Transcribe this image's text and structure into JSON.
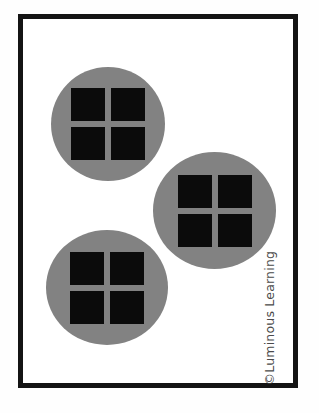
{
  "page": {
    "background_color": "#fefefe",
    "frame_color": "#141414",
    "frame_fill": "#ffffff"
  },
  "colors": {
    "circle_gray": "#828282",
    "square_black": "#0b0b0b",
    "copyright_gray": "#4a4a4a"
  },
  "manipulative": {
    "kind": "grouped-unit-squares",
    "group_count": 3,
    "squares_per_group": 4,
    "total_squares": 12,
    "groups": [
      {
        "id": "group-1",
        "label": "group-1",
        "position": "top-left",
        "center_x": 105,
        "center_y": 119,
        "radius": 57,
        "squares": [
          {
            "label": "square-1"
          },
          {
            "label": "square-2"
          },
          {
            "label": "square-3"
          },
          {
            "label": "square-4"
          }
        ]
      },
      {
        "id": "group-2",
        "label": "group-2",
        "position": "middle-right",
        "center_x": 215,
        "center_y": 206,
        "radius": 61,
        "squares": [
          {
            "label": "square-1"
          },
          {
            "label": "square-2"
          },
          {
            "label": "square-3"
          },
          {
            "label": "square-4"
          }
        ]
      },
      {
        "id": "group-3",
        "label": "group-3",
        "position": "bottom-left",
        "center_x": 107,
        "center_y": 283,
        "radius": 61,
        "squares": [
          {
            "label": "square-1"
          },
          {
            "label": "square-2"
          },
          {
            "label": "square-3"
          },
          {
            "label": "square-4"
          }
        ]
      }
    ]
  },
  "credit": {
    "copyright_text": "©Luminous Learning"
  }
}
